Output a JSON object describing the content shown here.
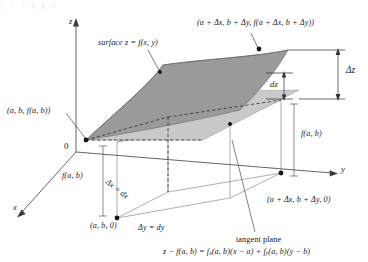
{
  "figure": {
    "title_fragment": "y y        y  g      g                            y",
    "axes": {
      "x_label": "x",
      "y_label": "y",
      "z_label": "z",
      "origin_label": "0"
    },
    "labels": {
      "surface": "surface z = f(x, y)",
      "corner_far": "(a + Δx, b + Δy, f(a + Δx, b + Δy))",
      "corner_near": "(a, b, f(a, b))",
      "delta_z": "Δz",
      "dz": "dz",
      "f_ab_left": "f(a, b)",
      "f_ab_right": "f(a, b)",
      "base_near": "(a, b, 0)",
      "base_far": "(a + Δx, b + Δy, 0)",
      "delta_x": "Δx = dx",
      "delta_y": "Δy = dy",
      "tangent_plane": "tangent plane"
    },
    "equation": {
      "lhs": "z − f(a, b) = f",
      "sub_x": "x",
      "mid": "(a, b)(x − a) + f",
      "sub_y": "y",
      "rhs": "(a, b)(y − b)"
    },
    "colors": {
      "surface_fill": "#9a9a9a",
      "tangent_fill": "#c9c9c9",
      "line": "#3a3a3a",
      "thin_line": "#8a8a8a",
      "background": "#ffffff",
      "text": "#19191c"
    }
  }
}
